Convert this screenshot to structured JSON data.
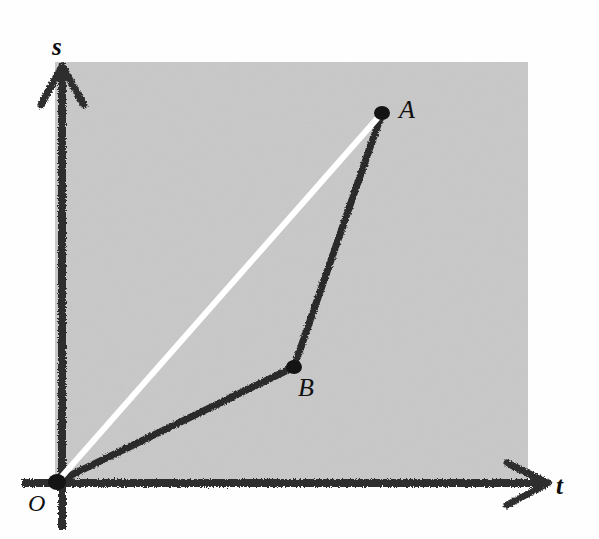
{
  "figure": {
    "background_color": "#ffffff",
    "plot_fill_color": "#c8c8c8",
    "ink_color": "#2b2b2b",
    "chord_color": "#ffffff",
    "width": 599,
    "height": 539
  },
  "axes": {
    "vertical": {
      "label": "s",
      "arrow": "up-arrow-icon",
      "x": 62,
      "top_y": 66,
      "bottom_y": 530
    },
    "horizontal": {
      "label": "t",
      "arrow": "right-arrow-icon",
      "y": 483,
      "left_x": 22,
      "right_x": 548
    },
    "origin_label": "O"
  },
  "chart_data": {
    "type": "line",
    "xlabel": "t",
    "ylabel": "s",
    "grid": false,
    "legend": false,
    "xlim": [
      0,
      1
    ],
    "ylim": [
      0,
      1
    ],
    "annotations": [
      {
        "text": "s",
        "role": "y-axis-label"
      },
      {
        "text": "t",
        "role": "x-axis-label"
      },
      {
        "text": "O",
        "role": "origin-label"
      },
      {
        "text": "A",
        "role": "point-label"
      },
      {
        "text": "B",
        "role": "point-label"
      }
    ],
    "series": [
      {
        "name": "path-OBA",
        "style": "solid-dark",
        "color": "#2b2b2b",
        "points": [
          {
            "label": "O",
            "px": [
              57,
              482
            ]
          },
          {
            "label": "B",
            "px": [
              294,
              367
            ]
          },
          {
            "label": "A",
            "px": [
              382,
              113
            ]
          }
        ]
      },
      {
        "name": "chord-OA",
        "style": "solid-white",
        "color": "#ffffff",
        "points": [
          {
            "label": "O",
            "px": [
              57,
              482
            ]
          },
          {
            "label": "A",
            "px": [
              382,
              113
            ]
          }
        ]
      }
    ],
    "markers": [
      {
        "label": "O",
        "px": [
          57,
          482
        ]
      },
      {
        "label": "B",
        "px": [
          294,
          367
        ]
      },
      {
        "label": "A",
        "px": [
          382,
          113
        ]
      }
    ]
  },
  "labels": {
    "s": "s",
    "t": "t",
    "O": "O",
    "A": "A",
    "B": "B"
  }
}
